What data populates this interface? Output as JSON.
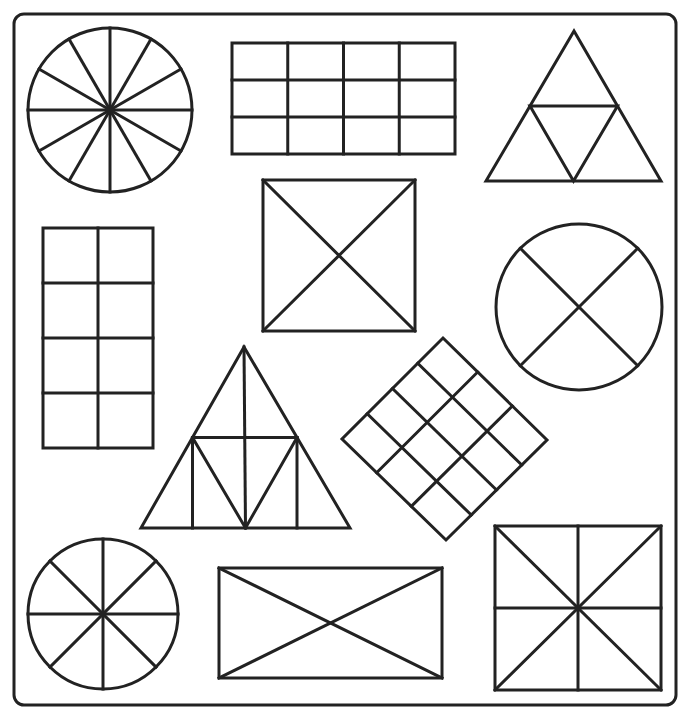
{
  "title": "Fraction shapes worksheet",
  "colors": {
    "stroke": "#222222",
    "background": "#ffffff"
  },
  "frame": {
    "x": 14,
    "y": 14,
    "w": 662,
    "h": 691,
    "r": 10
  },
  "shapes": [
    {
      "id": "circle-twelfths",
      "type": "circle-spokes",
      "cx": 110,
      "cy": 110,
      "r": 82,
      "parts": 12,
      "offsetDeg": 0,
      "label": "Circle divided into 12 equal parts"
    },
    {
      "id": "rect-grid-4x3",
      "type": "rect-grid",
      "x": 232,
      "y": 43,
      "w": 223,
      "h": 111,
      "cols": 4,
      "rows": 3,
      "label": "Rectangle divided into 12 equal parts"
    },
    {
      "id": "triangle-quarters",
      "type": "triangle-quarters",
      "apex": [
        574,
        31
      ],
      "left": [
        486,
        181
      ],
      "right": [
        661,
        181
      ],
      "label": "Triangle divided into 4 equal parts"
    },
    {
      "id": "square-x",
      "type": "rect-diagonals",
      "x": 263,
      "y": 180,
      "w": 152,
      "h": 151,
      "midlines": false,
      "label": "Square divided into 4 equal parts by diagonals"
    },
    {
      "id": "rect-grid-2x4",
      "type": "rect-grid",
      "x": 43,
      "y": 228,
      "w": 110,
      "h": 220,
      "cols": 2,
      "rows": 4,
      "label": "Rectangle divided into 8 equal parts"
    },
    {
      "id": "circle-quarters-x",
      "type": "circle-spokes",
      "cx": 579,
      "cy": 307,
      "r": 83,
      "parts": 4,
      "offsetDeg": 45,
      "label": "Circle divided into 4 equal parts"
    },
    {
      "id": "triangle-eighths",
      "type": "triangle-eighths",
      "apex": [
        244,
        347
      ],
      "left": [
        141,
        528
      ],
      "right": [
        350,
        528
      ],
      "label": "Triangle divided into 8 parts"
    },
    {
      "id": "diamond-grid",
      "type": "diamond-grid",
      "top": [
        443,
        338
      ],
      "left": [
        342,
        439
      ],
      "right": [
        547,
        440
      ],
      "bottom": [
        446,
        540
      ],
      "divA": 4,
      "divB": 3,
      "label": "Rotated rectangle divided into 12 equal parts"
    },
    {
      "id": "circle-eighths",
      "type": "circle-spokes",
      "cx": 103,
      "cy": 614,
      "r": 75,
      "parts": 8,
      "offsetDeg": 0,
      "label": "Circle divided into 8 equal parts"
    },
    {
      "id": "rect-x",
      "type": "rect-diagonals",
      "x": 219,
      "y": 568,
      "w": 223,
      "h": 110,
      "midlines": false,
      "label": "Rectangle divided into 4 parts by diagonals"
    },
    {
      "id": "square-eighths",
      "type": "rect-diagonals",
      "x": 495,
      "y": 526,
      "w": 166,
      "h": 164,
      "midlines": true,
      "label": "Square divided into 8 equal parts"
    }
  ]
}
